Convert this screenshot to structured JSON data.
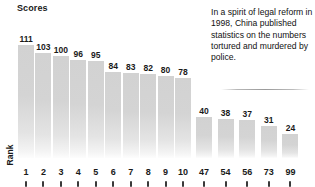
{
  "chart": {
    "y_axis_title": "Scores",
    "x_axis_title": "Rank"
  },
  "annotation": {
    "text": "In a spirit of legal reform in 1998, China published statistics on the numbers tortured and murdered by police."
  },
  "chart_data": {
    "type": "bar",
    "title": "",
    "xlabel": "Rank",
    "ylabel": "Scores",
    "categories": [
      "1",
      "2",
      "3",
      "4",
      "5",
      "6",
      "7",
      "8",
      "9",
      "10",
      "47",
      "54",
      "56",
      "73",
      "99"
    ],
    "values": [
      111,
      103,
      100,
      96,
      95,
      84,
      83,
      82,
      80,
      78,
      40,
      38,
      37,
      31,
      24
    ],
    "ylim": [
      0,
      120
    ],
    "grid": false,
    "legend": false,
    "note": "Two groups of bars separated by a gap: ranks 1-10 and ranks 47-99",
    "groups": [
      {
        "name": "top-ranks",
        "categories": [
          "1",
          "2",
          "3",
          "4",
          "5",
          "6",
          "7",
          "8",
          "9",
          "10"
        ],
        "values": [
          111,
          103,
          100,
          96,
          95,
          84,
          83,
          82,
          80,
          78
        ]
      },
      {
        "name": "lower-ranks",
        "categories": [
          "47",
          "54",
          "56",
          "73",
          "99"
        ],
        "values": [
          40,
          38,
          37,
          31,
          24
        ]
      }
    ],
    "annotations": [
      "In a spirit of legal reform in 1998, China published statistics on the numbers tortured and murdered by police."
    ]
  },
  "colors": {
    "bar": "#d4d4d4",
    "text": "#1a1a1a",
    "background": "#ffffff"
  }
}
